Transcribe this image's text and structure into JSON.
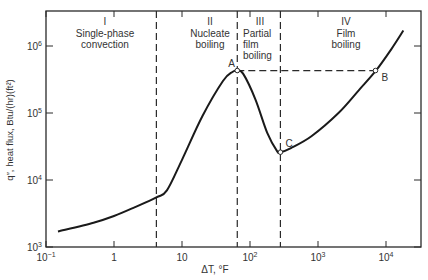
{
  "chart_data": {
    "type": "line",
    "title": "",
    "xlabel": "ΔT, °F",
    "ylabel": "q″, heat flux, Btu/(hr)(ft²)",
    "xscale": "log",
    "yscale": "log",
    "xlim": [
      0.1,
      30000
    ],
    "ylim": [
      1000,
      3000000
    ],
    "grid": false,
    "x_ticks": [
      {
        "value": 0.1,
        "base": "10",
        "exp": "−1"
      },
      {
        "value": 1,
        "base": "1",
        "exp": ""
      },
      {
        "value": 10,
        "base": "10",
        "exp": ""
      },
      {
        "value": 100,
        "base": "10",
        "exp": "2"
      },
      {
        "value": 1000,
        "base": "10",
        "exp": "3"
      },
      {
        "value": 10000,
        "base": "10",
        "exp": "4"
      }
    ],
    "y_ticks": [
      {
        "value": 1000,
        "base": "10",
        "exp": "3"
      },
      {
        "value": 10000,
        "base": "10",
        "exp": "4"
      },
      {
        "value": 100000,
        "base": "10",
        "exp": "5"
      },
      {
        "value": 1000000,
        "base": "10",
        "exp": "6"
      }
    ],
    "series": [
      {
        "name": "Boiling curve",
        "x": [
          0.15,
          0.5,
          1,
          2,
          4.2,
          6,
          10,
          20,
          40,
          55,
          65,
          80,
          120,
          180,
          250,
          280,
          400,
          800,
          2000,
          4000,
          7000,
          12000,
          18000
        ],
        "y": [
          1700,
          2300,
          2900,
          3900,
          5500,
          7000,
          20000,
          90000,
          300000,
          410000,
          430000,
          380000,
          160000,
          50000,
          27000,
          26000,
          30000,
          45000,
          100000,
          220000,
          420000,
          900000,
          1700000
        ]
      }
    ],
    "regions": [
      {
        "numeral": "I",
        "lines": [
          "Single-phase",
          "convection"
        ],
        "x_start": 0.1,
        "x_end": 4.2
      },
      {
        "numeral": "II",
        "lines": [
          "Nucleate",
          "boiling"
        ],
        "x_start": 4.2,
        "x_end": 65
      },
      {
        "numeral": "III",
        "lines": [
          "Partial",
          "film",
          "boiling"
        ],
        "x_start": 65,
        "x_end": 280
      },
      {
        "numeral": "IV",
        "lines": [
          "Film",
          "boiling"
        ],
        "x_start": 280,
        "x_end": 30000
      }
    ],
    "boundaries_x": [
      4.2,
      65,
      280
    ],
    "points": [
      {
        "label": "A",
        "x": 65,
        "y": 430000
      },
      {
        "label": "B",
        "x": 7000,
        "y": 430000
      },
      {
        "label": "C",
        "x": 280,
        "y": 26000
      }
    ],
    "annotations": [
      "Dashed horizontal line from A to B at q″ ≈ 4.3×10⁵"
    ]
  }
}
